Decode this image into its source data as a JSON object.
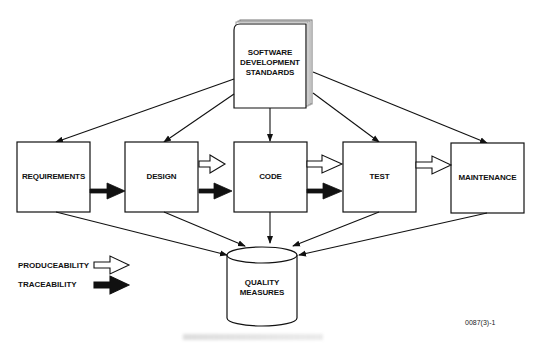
{
  "diagram": {
    "source": {
      "label_lines": [
        "SOFTWARE",
        "DEVELOPMENT",
        "STANDARDS"
      ],
      "shape": "book-stack"
    },
    "phases": [
      {
        "id": "requirements",
        "label": "REQUIREMENTS"
      },
      {
        "id": "design",
        "label": "DESIGN"
      },
      {
        "id": "code",
        "label": "CODE"
      },
      {
        "id": "test",
        "label": "TEST"
      },
      {
        "id": "maintenance",
        "label": "MAINTENANCE"
      }
    ],
    "sink": {
      "label_lines": [
        "QUALITY",
        "MEASURES"
      ],
      "shape": "cylinder"
    },
    "edges": {
      "standards_to_phases": [
        "requirements",
        "design",
        "code",
        "test",
        "maintenance"
      ],
      "phases_to_quality": [
        "requirements",
        "design",
        "code",
        "test",
        "maintenance"
      ],
      "produceability": [
        [
          "design",
          "code"
        ],
        [
          "code",
          "test"
        ],
        [
          "test",
          "maintenance"
        ]
      ],
      "traceability": [
        [
          "requirements",
          "design"
        ],
        [
          "design",
          "code"
        ],
        [
          "code",
          "test"
        ]
      ]
    },
    "legend": {
      "produceability_label": "PRODUCEABILITY",
      "traceability_label": "TRACEABILITY",
      "produceability_style": "hollow-arrow",
      "traceability_style": "solid-arrow"
    },
    "figure_id": "0087(3)-1",
    "colors": {
      "stroke": "#111111",
      "fill": "#ffffff",
      "solid_arrow": "#111111",
      "page_edge": "#9a9a9a"
    }
  }
}
